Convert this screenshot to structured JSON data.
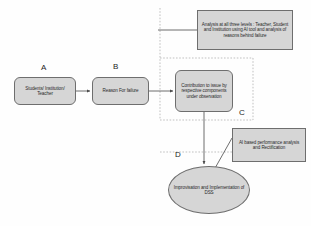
{
  "diagram": {
    "background": "#fefefe",
    "node_fill": "#d6d6d6",
    "node_stroke": "#6e6e6e",
    "connector_color": "#555555",
    "dashed_color": "#9a9a9a",
    "nodes": {
      "a": {
        "label": "Students/ Institution/ Teacher",
        "tag": "A",
        "shape": "rounded-rectangle"
      },
      "b": {
        "label": "Reason For failure",
        "tag": "B",
        "shape": "rounded-rectangle"
      },
      "c": {
        "label": "Contribution to issue by respective components under observation",
        "tag": "C",
        "shape": "rounded-rectangle"
      },
      "analysis": {
        "label": "Analysis at all three levels : Teacher, Student and Institution using AI tool and analysis of reasons behind failure",
        "shape": "rectangle"
      },
      "ai": {
        "label": "AI based performance analysis and Rectification",
        "shape": "rectangle"
      },
      "dss": {
        "label": "Improvisation and Implementation of DSS",
        "tag": "D",
        "shape": "ellipse"
      }
    },
    "connectors": [
      {
        "name": "a-to-b",
        "from": "a",
        "to": "b",
        "style": "solid",
        "arrow": true
      },
      {
        "name": "b-to-c",
        "from": "b",
        "to": "c",
        "style": "solid",
        "arrow": true
      },
      {
        "name": "analysis-to-region",
        "from": "analysis",
        "to": "region-boundary",
        "style": "solid",
        "arrow": false
      },
      {
        "name": "c-to-dss",
        "from": "c",
        "to": "dss",
        "style": "solid",
        "arrow": true
      },
      {
        "name": "ai-to-dss",
        "from": "ai",
        "to": "dss",
        "style": "solid",
        "arrow": false
      }
    ],
    "regions": [
      {
        "name": "region-c-boundary",
        "style": "dashed"
      },
      {
        "name": "region-d-boundary",
        "style": "dashed"
      }
    ]
  }
}
